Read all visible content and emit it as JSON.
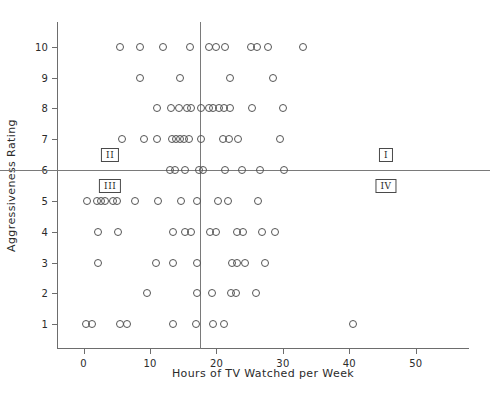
{
  "chart_data": {
    "type": "scatter",
    "title": "",
    "xlabel": "Hours of TV Watched per Week",
    "ylabel": "Aggressiveness Rating",
    "xlim": [
      -4,
      58
    ],
    "ylim": [
      0.2,
      10.8
    ],
    "xticks": [
      0,
      10,
      20,
      30,
      40,
      50
    ],
    "xticklabels": [
      "0",
      "10",
      "20",
      "30",
      "40",
      "50"
    ],
    "yticks": [
      1,
      2,
      3,
      4,
      5,
      6,
      7,
      8,
      9,
      10
    ],
    "yticklabels": [
      "1",
      "2",
      "3",
      "4",
      "5",
      "6",
      "7",
      "8",
      "9",
      "10"
    ],
    "grid": false,
    "legend": null,
    "marker": "open-circle",
    "reference_lines": [
      {
        "orientation": "horizontal",
        "value": 6,
        "axis": "y"
      },
      {
        "orientation": "vertical",
        "value": 17.5,
        "axis": "x"
      }
    ],
    "annotations": [
      {
        "text": "II",
        "x": 4.0,
        "y": 6.5,
        "boxed": true
      },
      {
        "text": "III",
        "x": 4.0,
        "y": 5.5,
        "boxed": true
      },
      {
        "text": "I",
        "x": 45.5,
        "y": 6.5,
        "boxed": true
      },
      {
        "text": "IV",
        "x": 45.5,
        "y": 5.5,
        "boxed": true
      }
    ],
    "points": [
      {
        "x": 5.5,
        "y": 10
      },
      {
        "x": 8.5,
        "y": 10
      },
      {
        "x": 12.0,
        "y": 10
      },
      {
        "x": 16.0,
        "y": 10
      },
      {
        "x": 18.8,
        "y": 10
      },
      {
        "x": 20.0,
        "y": 10
      },
      {
        "x": 21.3,
        "y": 10
      },
      {
        "x": 25.2,
        "y": 10
      },
      {
        "x": 26.1,
        "y": 10
      },
      {
        "x": 27.8,
        "y": 10
      },
      {
        "x": 33.0,
        "y": 10
      },
      {
        "x": 8.5,
        "y": 9
      },
      {
        "x": 14.5,
        "y": 9
      },
      {
        "x": 22.0,
        "y": 9
      },
      {
        "x": 28.5,
        "y": 9
      },
      {
        "x": 11.0,
        "y": 8
      },
      {
        "x": 13.2,
        "y": 8
      },
      {
        "x": 14.3,
        "y": 8
      },
      {
        "x": 15.6,
        "y": 8
      },
      {
        "x": 16.1,
        "y": 8
      },
      {
        "x": 17.7,
        "y": 8
      },
      {
        "x": 18.8,
        "y": 8
      },
      {
        "x": 19.5,
        "y": 8
      },
      {
        "x": 20.4,
        "y": 8
      },
      {
        "x": 21.2,
        "y": 8
      },
      {
        "x": 22.1,
        "y": 8
      },
      {
        "x": 25.4,
        "y": 8
      },
      {
        "x": 30.0,
        "y": 8
      },
      {
        "x": 5.8,
        "y": 7
      },
      {
        "x": 9.1,
        "y": 7
      },
      {
        "x": 11.1,
        "y": 7
      },
      {
        "x": 13.3,
        "y": 7
      },
      {
        "x": 13.9,
        "y": 7
      },
      {
        "x": 14.5,
        "y": 7
      },
      {
        "x": 15.1,
        "y": 7
      },
      {
        "x": 15.8,
        "y": 7
      },
      {
        "x": 17.6,
        "y": 7
      },
      {
        "x": 21.0,
        "y": 7
      },
      {
        "x": 21.9,
        "y": 7
      },
      {
        "x": 23.3,
        "y": 7
      },
      {
        "x": 29.5,
        "y": 7
      },
      {
        "x": 13.0,
        "y": 6
      },
      {
        "x": 13.8,
        "y": 6
      },
      {
        "x": 15.3,
        "y": 6
      },
      {
        "x": 17.4,
        "y": 6
      },
      {
        "x": 17.9,
        "y": 6
      },
      {
        "x": 21.3,
        "y": 6
      },
      {
        "x": 23.9,
        "y": 6
      },
      {
        "x": 26.6,
        "y": 6
      },
      {
        "x": 30.2,
        "y": 6
      },
      {
        "x": 0.5,
        "y": 5
      },
      {
        "x": 2.0,
        "y": 5
      },
      {
        "x": 2.6,
        "y": 5
      },
      {
        "x": 3.2,
        "y": 5
      },
      {
        "x": 4.5,
        "y": 5
      },
      {
        "x": 5.1,
        "y": 5
      },
      {
        "x": 7.8,
        "y": 5
      },
      {
        "x": 11.2,
        "y": 5
      },
      {
        "x": 14.6,
        "y": 5
      },
      {
        "x": 17.0,
        "y": 5
      },
      {
        "x": 20.3,
        "y": 5
      },
      {
        "x": 21.8,
        "y": 5
      },
      {
        "x": 26.2,
        "y": 5
      },
      {
        "x": 2.2,
        "y": 4
      },
      {
        "x": 5.2,
        "y": 4
      },
      {
        "x": 13.4,
        "y": 4
      },
      {
        "x": 15.3,
        "y": 4
      },
      {
        "x": 16.2,
        "y": 4
      },
      {
        "x": 19.0,
        "y": 4
      },
      {
        "x": 19.9,
        "y": 4
      },
      {
        "x": 23.1,
        "y": 4
      },
      {
        "x": 24.0,
        "y": 4
      },
      {
        "x": 26.9,
        "y": 4
      },
      {
        "x": 28.8,
        "y": 4
      },
      {
        "x": 2.2,
        "y": 3
      },
      {
        "x": 10.9,
        "y": 3
      },
      {
        "x": 13.4,
        "y": 3
      },
      {
        "x": 17.0,
        "y": 3
      },
      {
        "x": 22.4,
        "y": 3
      },
      {
        "x": 23.1,
        "y": 3
      },
      {
        "x": 24.3,
        "y": 3
      },
      {
        "x": 27.3,
        "y": 3
      },
      {
        "x": 9.6,
        "y": 2
      },
      {
        "x": 17.0,
        "y": 2
      },
      {
        "x": 19.4,
        "y": 2
      },
      {
        "x": 22.2,
        "y": 2
      },
      {
        "x": 23.0,
        "y": 2
      },
      {
        "x": 26.0,
        "y": 2
      },
      {
        "x": 0.3,
        "y": 1
      },
      {
        "x": 1.2,
        "y": 1
      },
      {
        "x": 5.5,
        "y": 1
      },
      {
        "x": 6.6,
        "y": 1
      },
      {
        "x": 13.5,
        "y": 1
      },
      {
        "x": 16.9,
        "y": 1
      },
      {
        "x": 19.5,
        "y": 1
      },
      {
        "x": 21.2,
        "y": 1
      },
      {
        "x": 40.5,
        "y": 1
      }
    ]
  }
}
